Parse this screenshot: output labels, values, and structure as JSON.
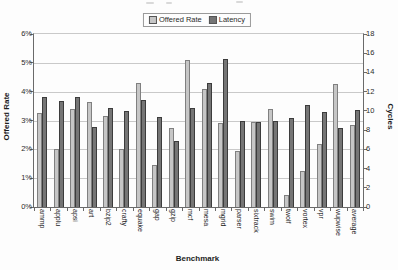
{
  "legend": {
    "items": [
      {
        "label": "Offered Rate",
        "color": "#c6c6c6"
      },
      {
        "label": "Latency",
        "color": "#757575"
      }
    ]
  },
  "chart_data": {
    "type": "bar",
    "title": "",
    "categories": [
      "ammp",
      "applu",
      "apsi",
      "art",
      "bzip2",
      "crafty",
      "equake",
      "gap",
      "gzip",
      "mcf",
      "mesa",
      "mgrid",
      "parser",
      "sixtrack",
      "swim",
      "twolf",
      "vortex",
      "vpr",
      "wupwise",
      "average"
    ],
    "series": [
      {
        "name": "Offered Rate",
        "axis": "left",
        "unit": "%",
        "color": "#c6c6c6",
        "values": [
          3.25,
          2.0,
          3.4,
          3.65,
          3.15,
          2.0,
          4.3,
          1.45,
          2.75,
          5.1,
          4.1,
          2.9,
          1.95,
          2.95,
          3.4,
          0.4,
          1.25,
          2.2,
          4.25,
          2.85
        ]
      },
      {
        "name": "Latency",
        "axis": "right",
        "unit": "cycles",
        "color": "#757575",
        "values": [
          11.4,
          11.0,
          11.4,
          8.3,
          10.3,
          10.0,
          11.1,
          9.4,
          6.9,
          10.3,
          12.9,
          15.4,
          8.9,
          8.8,
          9.0,
          9.3,
          10.6,
          9.9,
          8.2,
          10.1
        ]
      }
    ],
    "xlabel": "Benchmark",
    "ylabel_left": "Offered Rate",
    "ylabel_right": "Cycles",
    "y_left": {
      "min": 0,
      "max": 6,
      "tick_labels": [
        "0%",
        "1%",
        "2%",
        "3%",
        "4%",
        "5%",
        "6%"
      ]
    },
    "y_right": {
      "min": 0,
      "max": 18,
      "tick_labels": [
        "0",
        "2",
        "4",
        "6",
        "8",
        "10",
        "12",
        "14",
        "16",
        "18"
      ]
    },
    "grid": true,
    "legend_position": "top-center"
  },
  "colors": {
    "offered_bar": "#c6c6c6",
    "latency_bar": "#757575",
    "gridline": "#c9c9c9",
    "axis": "#6a6a6a",
    "background": "#fdfdfd"
  }
}
